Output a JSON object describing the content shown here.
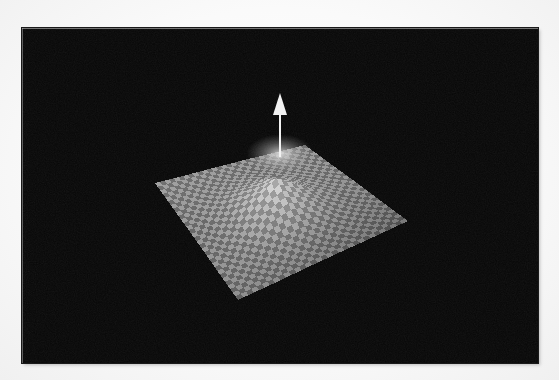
{
  "figure": {
    "kind": "3d-surface-plot",
    "caption": "",
    "background_color": "#060606",
    "page_color": "#fbfbfb",
    "panel": {
      "x": 22,
      "y": 28,
      "width": 516,
      "height": 335
    },
    "alt_text": "Grayscale 3D surface mesh plot with a central Gaussian peak and a white vertical arrow rising from the peak, on a black background."
  },
  "chart_data": {
    "type": "surface",
    "title": "",
    "subtitle": "",
    "xlabel": "",
    "ylabel": "",
    "zlabel": "",
    "grid": true,
    "legend": null,
    "colormap": "grayscale",
    "surface_style": "checkerboard-mesh",
    "projection": "oblique-3d",
    "mesh": {
      "nx": 32,
      "ny": 32,
      "cell_shading": [
        "#8c8c8c",
        "#5a5a5a"
      ],
      "corners_px": {
        "left": [
          155,
          183
        ],
        "top": [
          305,
          145
        ],
        "right": [
          408,
          221
        ],
        "bottom": [
          238,
          300
        ]
      }
    },
    "x": [
      -2.0,
      -1.5,
      -1.0,
      -0.5,
      0.0,
      0.5,
      1.0,
      1.5,
      2.0
    ],
    "y": [
      -2.0,
      -1.5,
      -1.0,
      -0.5,
      0.0,
      0.5,
      1.0,
      1.5,
      2.0
    ],
    "z_function": "gaussian-bump",
    "z": [
      [
        0.0,
        0.0,
        0.0,
        0.01,
        0.01,
        0.01,
        0.0,
        0.0,
        0.0
      ],
      [
        0.0,
        0.01,
        0.02,
        0.04,
        0.05,
        0.04,
        0.02,
        0.01,
        0.0
      ],
      [
        0.0,
        0.02,
        0.08,
        0.18,
        0.24,
        0.18,
        0.08,
        0.02,
        0.0
      ],
      [
        0.01,
        0.04,
        0.18,
        0.45,
        0.61,
        0.45,
        0.18,
        0.04,
        0.01
      ],
      [
        0.01,
        0.05,
        0.24,
        0.61,
        1.0,
        0.61,
        0.24,
        0.05,
        0.01
      ],
      [
        0.01,
        0.04,
        0.18,
        0.45,
        0.61,
        0.45,
        0.18,
        0.04,
        0.01
      ],
      [
        0.0,
        0.02,
        0.08,
        0.18,
        0.24,
        0.18,
        0.08,
        0.02,
        0.0
      ],
      [
        0.0,
        0.01,
        0.02,
        0.04,
        0.05,
        0.04,
        0.02,
        0.01,
        0.0
      ],
      [
        0.0,
        0.0,
        0.0,
        0.01,
        0.01,
        0.01,
        0.0,
        0.0,
        0.0
      ]
    ],
    "zlim": [
      0,
      1
    ],
    "annotations": [
      {
        "type": "arrow",
        "name": "peak-normal-vector",
        "color": "#f2f2f2",
        "label": "",
        "base_px": [
          280,
          157
        ],
        "tip_px": [
          280,
          93
        ],
        "head_length_px": 20,
        "head_width_px": 14,
        "shaft_width_px": 2
      }
    ],
    "peak": {
      "position_px": [
        280,
        160
      ],
      "value": 1.0,
      "highlight_color": "#d6d6d6"
    }
  }
}
